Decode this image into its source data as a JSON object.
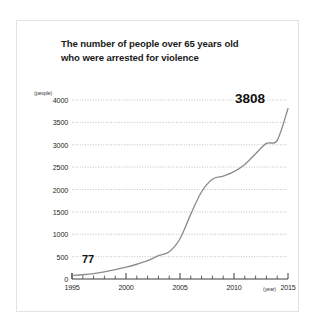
{
  "figure": {
    "title_line1": "The number of people over 65 years old",
    "title_line2": "who were arrested for violence",
    "background_color": "#ffffff",
    "frame_color": "#e3e3e3"
  },
  "chart_data": {
    "type": "line",
    "title": "The number of people over 65 years old who were arrested for violence",
    "xlabel": "(year)",
    "ylabel": "(people)",
    "xlim": [
      1995,
      2015
    ],
    "ylim": [
      0,
      4000
    ],
    "ytick_step": 500,
    "xtick_step": 1,
    "xtick_label_step": 5,
    "grid": "horizontal-dotted",
    "legend": "none",
    "line_color": "#8c8c8c",
    "y_tick_labels": [
      "4000",
      "3500",
      "3000",
      "2500",
      "2000",
      "1500",
      "1000",
      "500",
      "0"
    ],
    "y_ticks": [
      4000,
      3500,
      3000,
      2500,
      2000,
      1500,
      1000,
      500,
      0
    ],
    "x_tick_labels": [
      "1995",
      "2000",
      "2005",
      "2010",
      "2015"
    ],
    "x_ticks": [
      1995,
      2000,
      2005,
      2010,
      2015
    ],
    "x": [
      1995,
      1996,
      1997,
      1998,
      1999,
      2000,
      2001,
      2002,
      2003,
      2004,
      2005,
      2006,
      2007,
      2008,
      2009,
      2010,
      2011,
      2012,
      2013,
      2014,
      2015
    ],
    "values": [
      77,
      95,
      120,
      160,
      210,
      265,
      330,
      410,
      520,
      610,
      900,
      1450,
      1950,
      2230,
      2300,
      2400,
      2560,
      2800,
      3030,
      3100,
      3808
    ],
    "annotations": [
      {
        "label": "77",
        "x": 1995,
        "y": 77
      },
      {
        "label": "3808",
        "x": 2015,
        "y": 3808
      }
    ]
  }
}
